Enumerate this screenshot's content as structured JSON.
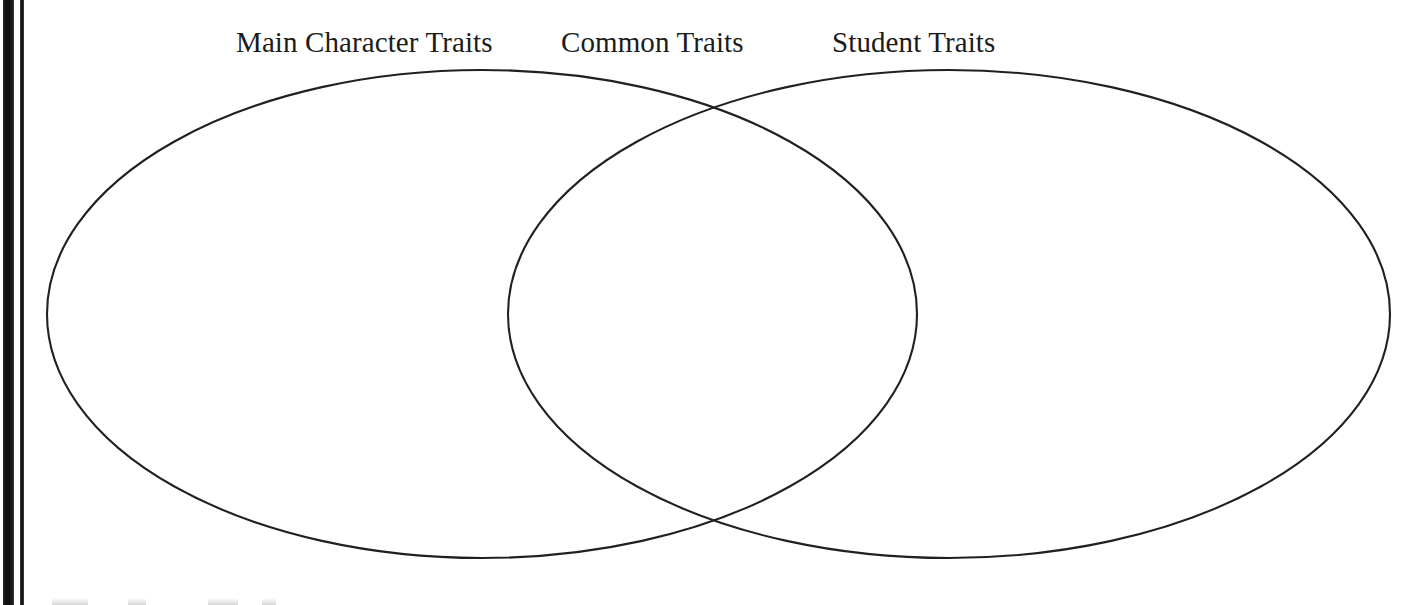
{
  "page": {
    "width": 1425,
    "height": 605,
    "background_color": "#ffffff",
    "type": "scanned-worksheet"
  },
  "scan_artifacts": {
    "binding_bar_color": "#101010",
    "thick_bar": {
      "x": 3,
      "width": 11
    },
    "thin_bar": {
      "x": 20,
      "width": 4
    },
    "bottom_clipped_marks": 4
  },
  "diagram": {
    "kind": "venn-diagram",
    "set_count": 2,
    "stroke_color": "#221f1f",
    "stroke_width": 2.1,
    "fill": "none",
    "labels": [
      {
        "id": "main-character-traits",
        "text": "Main Character Traits",
        "region": "left-only"
      },
      {
        "id": "common-traits",
        "text": "Common Traits",
        "region": "intersection"
      },
      {
        "id": "student-traits",
        "text": "Student Traits",
        "region": "right-only"
      }
    ],
    "ellipses": [
      {
        "id": "left-set",
        "label": "Main Character Traits",
        "cx": 482,
        "cy": 314,
        "rx": 435,
        "ry": 244
      },
      {
        "id": "right-set",
        "label": "Student Traits",
        "cx": 949,
        "cy": 314,
        "rx": 441,
        "ry": 244
      }
    ],
    "intersection_points": [
      {
        "x": 705,
        "y": 105
      },
      {
        "x": 735,
        "y": 520
      }
    ]
  }
}
